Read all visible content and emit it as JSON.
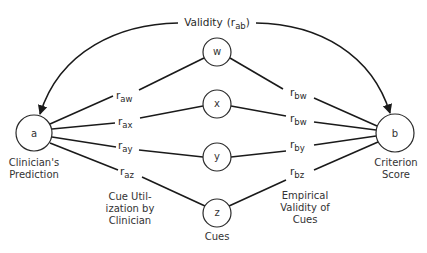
{
  "title": {
    "label": "Validity",
    "open_paren": "(",
    "r": "r",
    "sub": "ab",
    "close_paren": ")"
  },
  "nodes": {
    "a": {
      "label": "a",
      "caption": [
        "Clinician's",
        "Prediction"
      ]
    },
    "b": {
      "label": "b",
      "caption": [
        "Criterion",
        "Score"
      ]
    },
    "w": {
      "label": "w"
    },
    "x": {
      "label": "x"
    },
    "y": {
      "label": "y"
    },
    "z": {
      "label": "z",
      "caption": [
        "Cues"
      ]
    }
  },
  "left_edges": [
    {
      "r": "r",
      "sub": "aw"
    },
    {
      "r": "r",
      "sub": "ax"
    },
    {
      "r": "r",
      "sub": "ay"
    },
    {
      "r": "r",
      "sub": "az"
    }
  ],
  "right_edges": [
    {
      "r": "r",
      "sub": "bw"
    },
    {
      "r": "r",
      "sub": "bw"
    },
    {
      "r": "r",
      "sub": "by"
    },
    {
      "r": "r",
      "sub": "bz"
    }
  ],
  "group_captions": {
    "left": [
      "Cue Util-",
      "ization by",
      "Clinician"
    ],
    "right": [
      "Empirical",
      "Validity of",
      "Cues"
    ]
  }
}
